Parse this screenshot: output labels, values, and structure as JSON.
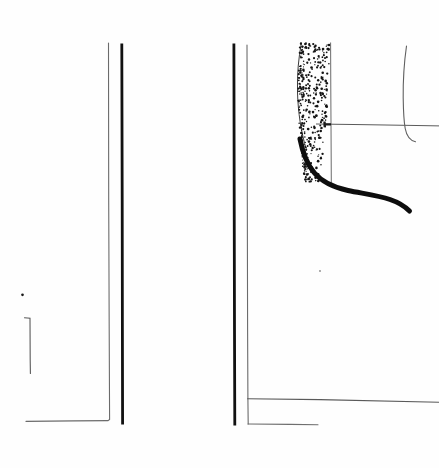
{
  "document": {
    "kind": "scanned-technical-line-drawing",
    "page_width": 439,
    "page_height": 468,
    "background_color": "#fefefe",
    "ink_color": "#111111",
    "light_ink_color": "#6b6b6b",
    "mid_ink_color": "#4a4a4a",
    "caption": "",
    "title": "",
    "visible_text": []
  },
  "figure": {
    "name": "profile-drawing",
    "panels": [
      {
        "id": "left-panel",
        "name": "left-section",
        "label": ""
      },
      {
        "id": "right-panel",
        "name": "right-section",
        "label": ""
      }
    ]
  },
  "strokes": {
    "left_panel_thin_rule": {
      "name": "left-thin-vertical-rule",
      "color": "#6b6b6b",
      "width": 1.1,
      "path": "M108.5,43 L108.7,200 L109.2,330 L109.6,419.5 L108.0,420.6 L74.0,420.9 L26.0,421.4"
    },
    "left_panel_thick_rule": {
      "name": "left-thick-vertical-rule",
      "color": "#111111",
      "width": 2.8,
      "path": "M121.8,43.5 L122.2,200 L122.4,330 L122.6,424.5"
    },
    "left_bracket": {
      "name": "left-corner-bracket",
      "color": "#5a5a5a",
      "width": 1.1,
      "path": "M24.5,317.8 L30.0,318.3 L30.2,360 L30.4,373.5"
    },
    "left_dot": {
      "name": "left-ink-dot",
      "color": "#1a1a1a",
      "cx": 22.5,
      "cy": 294.8,
      "r": 1.35
    },
    "right_panel_thick_rule": {
      "name": "right-thick-vertical-rule",
      "color": "#111111",
      "width": 2.8,
      "path": "M233.9,43.5 L234.2,200 L234.5,330 L234.8,425.5"
    },
    "right_panel_thin_rule": {
      "name": "right-thin-vertical-rule",
      "color": "#6b6b6b",
      "width": 1.1,
      "path": "M247.0,45 L247.3,200 L247.6,330 L247.9,398.5 L248.2,424.0"
    },
    "right_lower_horizontal_upper": {
      "name": "right-upper-baseline",
      "color": "#5a5a5a",
      "width": 1.1,
      "path": "M247.6,398.8 L320,399.6 L439,402.2"
    },
    "right_lower_horizontal_lower": {
      "name": "right-lower-baseline",
      "color": "#6f6f6f",
      "width": 1.1,
      "path": "M248.0,424.0 L290,424.4 L318,424.8"
    },
    "stipple_right_edge": {
      "name": "stipple-right-boundary",
      "color": "#6b6b6b",
      "width": 1.0,
      "path": "M330.6,42.5 L330.8,90 L331.0,124 L331.2,160 L331.3,183"
    },
    "stipple_outer_edge": {
      "name": "stipple-outer-contour",
      "color": "#3a3a3a",
      "width": 1.0,
      "path": "M301.5,42.5 C298.5,58 297.0,74 297.5,92 C298.0,112 301.0,132 306.5,150"
    },
    "measure_horizontal": {
      "name": "measurement-reference-line",
      "color": "#5a5a5a",
      "width": 1.0,
      "path": "M316.0,124.0 L360,124.6 L410,125.4 L439,125.9"
    },
    "measure_tick": {
      "name": "measurement-arrow-tick",
      "color": "#1a1a1a",
      "width": 2.4,
      "path": "M324.5,121.5 L324.8,127.2 M324.5,124.2 L331.0,124.4"
    },
    "thick_curve": {
      "name": "thick-profile-curve",
      "color": "#0d0d0d",
      "width": 5.0,
      "path": "M300.0,139 C302.5,152 307.0,164 314.0,172.5 C322.0,182 334.0,187.5 348.0,190.5 C363.0,193.6 378.0,195.4 390.0,199.5 C398.0,202.2 404.5,206.0 409.5,211.0"
    },
    "right_hook_curve": {
      "name": "right-hook-contour",
      "color": "#5f5f5f",
      "width": 1.1,
      "path": "M406.5,46.0 C404.2,62 403.0,80 403.2,98 C403.4,112 404.0,122 405.2,128.5 C406.6,136 410.0,140.5 415.5,141.8"
    },
    "faint_dot_lower": {
      "name": "faint-ink-speck",
      "color": "#8a8a8a",
      "cx": 320.0,
      "cy": 271.0,
      "r": 0.9
    }
  },
  "stipple": {
    "name": "stipple-fill-region",
    "dot_color": "#141414",
    "description": "dense-to-sparse dotted cross-section shading",
    "seed": 20250614,
    "count": 330,
    "region": {
      "top": 43,
      "bottom": 182,
      "left_top": 300,
      "right_top": 330,
      "left_bottom": 304,
      "right_bottom": 331
    }
  }
}
